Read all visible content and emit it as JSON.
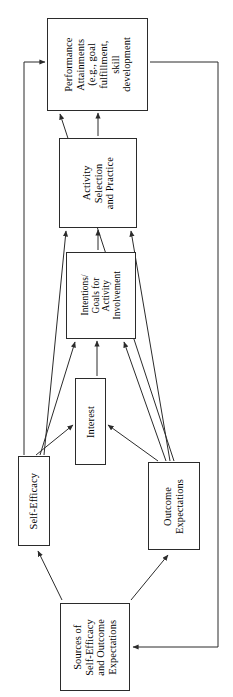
{
  "diagram": {
    "orientation": "rotated-90-ccw",
    "line_color": "#2b2b2b",
    "box_fill": "#ffffff",
    "nodes": [
      {
        "id": "performance",
        "label": "Performance\nAttainments\n(e.g., goal\nfulfillment,\nskill\ndevelopment"
      },
      {
        "id": "activity",
        "label": "Activity\nSelection\nand Practice"
      },
      {
        "id": "intentions",
        "label": "Intentions/\nGoals for\nActivity\nInvolvement"
      },
      {
        "id": "interest",
        "label": "Interest"
      },
      {
        "id": "self_efficacy",
        "label": "Self-Efficacy"
      },
      {
        "id": "outcome",
        "label": "Outcome\nExpectations"
      },
      {
        "id": "sources",
        "label": "Sources of\nSelf-Efficacy\nand Outcome\nExpectations"
      }
    ],
    "edges": [
      {
        "from": "activity",
        "to": "performance",
        "kind": "straight"
      },
      {
        "from": "intentions",
        "to": "activity",
        "kind": "straight"
      },
      {
        "from": "self_efficacy",
        "to": "activity",
        "kind": "diagonal"
      },
      {
        "from": "outcome",
        "to": "activity",
        "kind": "diagonal"
      },
      {
        "from": "interest",
        "to": "intentions",
        "kind": "straight"
      },
      {
        "from": "self_efficacy",
        "to": "intentions",
        "kind": "diagonal"
      },
      {
        "from": "outcome",
        "to": "intentions",
        "kind": "diagonal"
      },
      {
        "from": "self_efficacy",
        "to": "interest",
        "kind": "diagonal"
      },
      {
        "from": "outcome",
        "to": "interest",
        "kind": "diagonal"
      },
      {
        "from": "self_efficacy",
        "to": "performance",
        "kind": "routed-left"
      },
      {
        "from": "outcome",
        "to": "performance",
        "kind": "diagonal"
      },
      {
        "from": "sources",
        "to": "self_efficacy",
        "kind": "diagonal"
      },
      {
        "from": "sources",
        "to": "outcome",
        "kind": "diagonal"
      },
      {
        "from": "performance",
        "to": "sources",
        "kind": "routed-right-feedback"
      }
    ]
  }
}
